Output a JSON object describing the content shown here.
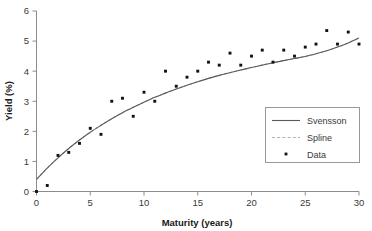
{
  "chart_data": {
    "type": "scatter",
    "title": "",
    "xlabel": "Maturity (years)",
    "ylabel": "Yield (%)",
    "xlim": [
      0,
      30
    ],
    "ylim": [
      0,
      6
    ],
    "xticks": [
      0,
      5,
      10,
      15,
      20,
      25,
      30
    ],
    "yticks": [
      0,
      1,
      2,
      3,
      4,
      5,
      6
    ],
    "grid": false,
    "legend_position": "lower-right",
    "legend": [
      {
        "label": "Svensson",
        "marker": "line-solid",
        "color": "#555555"
      },
      {
        "label": "Spline",
        "marker": "line-dashed",
        "color": "#aaaaaa"
      },
      {
        "label": "Data",
        "marker": "square-point",
        "color": "#111111"
      }
    ],
    "x": [
      0,
      1,
      2,
      3,
      4,
      5,
      6,
      7,
      8,
      9,
      10,
      11,
      12,
      13,
      14,
      15,
      16,
      17,
      18,
      19,
      20,
      21,
      22,
      23,
      24,
      25,
      26,
      27,
      28,
      29,
      30
    ],
    "series": [
      {
        "name": "Data",
        "type": "scatter",
        "values": [
          0.0,
          0.2,
          1.2,
          1.3,
          1.6,
          2.1,
          1.9,
          3.0,
          3.1,
          2.5,
          3.3,
          3.0,
          4.0,
          3.5,
          3.8,
          4.0,
          4.3,
          4.2,
          4.6,
          4.2,
          4.5,
          4.7,
          4.3,
          4.7,
          4.5,
          4.8,
          4.9,
          5.35,
          4.9,
          5.3,
          4.9
        ]
      },
      {
        "name": "Svensson",
        "type": "line",
        "values": [
          0.4,
          0.78,
          1.12,
          1.43,
          1.71,
          1.97,
          2.2,
          2.42,
          2.62,
          2.8,
          2.97,
          3.13,
          3.27,
          3.41,
          3.53,
          3.65,
          3.76,
          3.86,
          3.95,
          4.04,
          4.12,
          4.2,
          4.28,
          4.35,
          4.42,
          4.49,
          4.58,
          4.68,
          4.8,
          4.94,
          5.1
        ]
      },
      {
        "name": "Spline",
        "type": "line",
        "values": [
          0.4,
          0.78,
          1.12,
          1.43,
          1.71,
          1.97,
          2.2,
          2.42,
          2.62,
          2.8,
          2.97,
          3.13,
          3.27,
          3.41,
          3.53,
          3.65,
          3.76,
          3.86,
          3.95,
          4.04,
          4.12,
          4.2,
          4.28,
          4.35,
          4.42,
          4.49,
          4.58,
          4.68,
          4.8,
          4.94,
          5.1
        ]
      }
    ]
  },
  "axis": {
    "x_tick_labels": [
      "0",
      "5",
      "10",
      "15",
      "20",
      "25",
      "30"
    ],
    "y_tick_labels": [
      "0",
      "1",
      "2",
      "3",
      "4",
      "5",
      "6"
    ],
    "x_title": "Maturity (years)",
    "y_title": "Yield (%)"
  },
  "legend": {
    "svensson_label": "Svensson",
    "spline_label": "Spline",
    "data_label": "Data"
  },
  "colors": {
    "axis": "#8c8c8c",
    "svensson_line": "#5a5a5a",
    "spline_line": "#b0b0b0",
    "data_marker": "#111111",
    "text": "#333333",
    "legend_border": "#999999",
    "background": "#ffffff"
  }
}
